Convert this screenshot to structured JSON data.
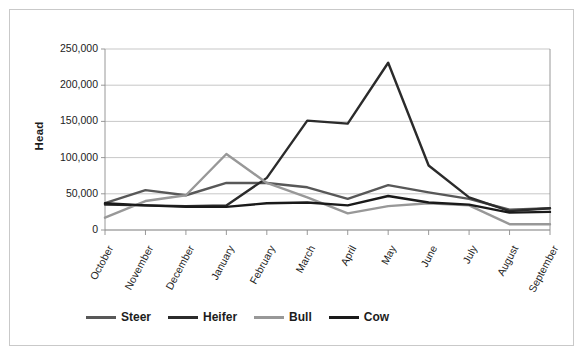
{
  "chart_data": {
    "type": "line",
    "title": "",
    "xlabel": "",
    "ylabel": "Head",
    "ylim": [
      0,
      250000
    ],
    "ytick_values": [
      0,
      50000,
      100000,
      150000,
      200000,
      250000
    ],
    "ytick_labels": [
      "0",
      "50,000",
      "100,000",
      "150,000",
      "200,000",
      "250,000"
    ],
    "grid": "horizontal",
    "legend_position": "bottom",
    "categories": [
      "October",
      "November",
      "December",
      "January",
      "February",
      "March",
      "April",
      "May",
      "June",
      "July",
      "August",
      "September"
    ],
    "series": [
      {
        "name": "Steer",
        "color": "#585858",
        "values": [
          37000,
          55000,
          48000,
          65000,
          65000,
          59000,
          43000,
          62000,
          52000,
          43000,
          28000,
          30000
        ]
      },
      {
        "name": "Heifer",
        "color": "#2b2b2b",
        "values": [
          35000,
          34000,
          33000,
          34000,
          72000,
          151000,
          147000,
          231000,
          89000,
          45000,
          26000,
          30000
        ]
      },
      {
        "name": "Bull",
        "color": "#989898",
        "values": [
          17000,
          40000,
          48000,
          105000,
          65000,
          45000,
          23000,
          33000,
          37000,
          34000,
          8000,
          8000
        ]
      },
      {
        "name": "Cow",
        "color": "#1a1a1a",
        "values": [
          37000,
          34000,
          32000,
          32000,
          37000,
          38000,
          34000,
          47000,
          38000,
          35000,
          24000,
          25000
        ]
      }
    ]
  },
  "legend": {
    "items": [
      {
        "label": "Steer",
        "color": "#585858"
      },
      {
        "label": "Heifer",
        "color": "#2b2b2b"
      },
      {
        "label": "Bull",
        "color": "#989898"
      },
      {
        "label": "Cow",
        "color": "#1a1a1a"
      }
    ]
  },
  "style": {
    "frame_border": "#c9c9c9",
    "gridline": "#b9b9b9",
    "axis": "#8d8d8d",
    "text": "#1c1c1c",
    "background": "#ffffff"
  }
}
